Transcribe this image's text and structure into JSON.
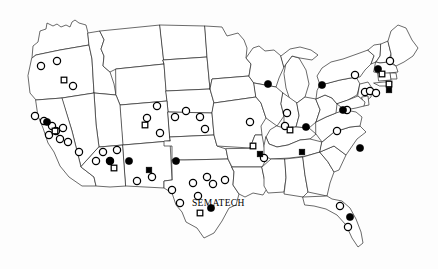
{
  "figure": {
    "title": "SEMATECH",
    "background_color": "#fdfdfd",
    "outline_color": "#2b2b2b",
    "marker_color": "#000000"
  },
  "labels": [
    {
      "id": "sematech",
      "text": "SEMATECH",
      "x": 192,
      "y": 206
    }
  ],
  "chart_data": {
    "type": "scatter",
    "title": "SEMATECH",
    "xlabel": "",
    "ylabel": "",
    "legend_position": "none",
    "grid": false,
    "marker_types": [
      {
        "key": "open-circle",
        "shape": "circle",
        "fill": "none",
        "stroke": "#000000"
      },
      {
        "key": "filled-circle",
        "shape": "circle",
        "fill": "#000000",
        "stroke": "#000000"
      },
      {
        "key": "open-square",
        "shape": "square",
        "fill": "none",
        "stroke": "#000000"
      },
      {
        "key": "filled-square",
        "shape": "square",
        "fill": "#000000",
        "stroke": "#000000"
      }
    ],
    "series": [
      {
        "name": "open-circle",
        "count": 45,
        "points": [
          [
            41,
            66
          ],
          [
            57,
            61
          ],
          [
            73,
            86
          ],
          [
            35,
            116
          ],
          [
            44,
            121
          ],
          [
            52,
            126
          ],
          [
            56,
            131
          ],
          [
            63,
            128
          ],
          [
            49,
            135
          ],
          [
            60,
            139
          ],
          [
            68,
            142
          ],
          [
            79,
            152
          ],
          [
            103,
            152
          ],
          [
            117,
            150
          ],
          [
            96,
            161
          ],
          [
            110,
            161
          ],
          [
            137,
            181
          ],
          [
            157,
            106
          ],
          [
            147,
            118
          ],
          [
            160,
            133
          ],
          [
            175,
            117
          ],
          [
            186,
            111
          ],
          [
            200,
            117
          ],
          [
            205,
            129
          ],
          [
            152,
            177
          ],
          [
            193,
            183
          ],
          [
            207,
            177
          ],
          [
            213,
            184
          ],
          [
            225,
            180
          ],
          [
            198,
            196
          ],
          [
            180,
            203
          ],
          [
            172,
            190
          ],
          [
            250,
            122
          ],
          [
            264,
            158
          ],
          [
            287,
            113
          ],
          [
            285,
            126
          ],
          [
            337,
            131
          ],
          [
            347,
            110
          ],
          [
            355,
            75
          ],
          [
            365,
            92
          ],
          [
            370,
            91
          ],
          [
            376,
            93
          ],
          [
            390,
            61
          ],
          [
            340,
            206
          ],
          [
            348,
            227
          ]
        ]
      },
      {
        "name": "filled-circle",
        "count": 12,
        "points": [
          [
            47,
            122
          ],
          [
            110,
            161
          ],
          [
            129,
            161
          ],
          [
            176,
            161
          ],
          [
            211,
            208
          ],
          [
            268,
            84
          ],
          [
            322,
            85
          ],
          [
            306,
            127
          ],
          [
            343,
            110
          ],
          [
            360,
            148
          ],
          [
            350,
            217
          ],
          [
            378,
            69
          ]
        ]
      },
      {
        "name": "open-square",
        "count": 9,
        "points": [
          [
            64,
            80
          ],
          [
            55,
            131
          ],
          [
            114,
            168
          ],
          [
            145,
            125
          ],
          [
            200,
            213
          ],
          [
            253,
            146
          ],
          [
            290,
            130
          ],
          [
            382,
            74
          ],
          [
            389,
            84
          ]
        ]
      },
      {
        "name": "filled-square",
        "count": 4,
        "points": [
          [
            149,
            170
          ],
          [
            260,
            154
          ],
          [
            302,
            152
          ],
          [
            389,
            90
          ]
        ]
      }
    ]
  }
}
